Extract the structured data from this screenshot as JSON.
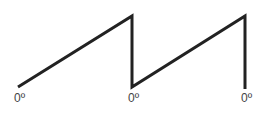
{
  "diagram": {
    "type": "sawtooth-waveform",
    "stroke_color": "#222222",
    "points": [
      [
        18,
        87
      ],
      [
        132,
        16
      ],
      [
        132,
        87
      ],
      [
        245,
        16
      ],
      [
        245,
        89
      ]
    ],
    "labels": [
      {
        "text": "0º",
        "x": 14,
        "y": 92
      },
      {
        "text": "0º",
        "x": 128,
        "y": 92
      },
      {
        "text": "0º",
        "x": 241,
        "y": 92
      }
    ]
  }
}
